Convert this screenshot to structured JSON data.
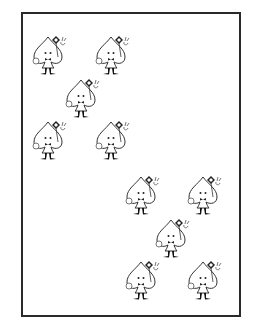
{
  "card": {
    "description": "Card with ten cartoon spade characters holding diamond-shaped wands",
    "character_count": 10,
    "border_color": "#2a2a2a",
    "characters": [
      {
        "x": 50,
        "y": 55
      },
      {
        "x": 113,
        "y": 55
      },
      {
        "x": 83,
        "y": 98
      },
      {
        "x": 50,
        "y": 140
      },
      {
        "x": 113,
        "y": 140
      },
      {
        "x": 143,
        "y": 195
      },
      {
        "x": 205,
        "y": 195
      },
      {
        "x": 173,
        "y": 238
      },
      {
        "x": 143,
        "y": 280
      },
      {
        "x": 205,
        "y": 280
      }
    ]
  }
}
